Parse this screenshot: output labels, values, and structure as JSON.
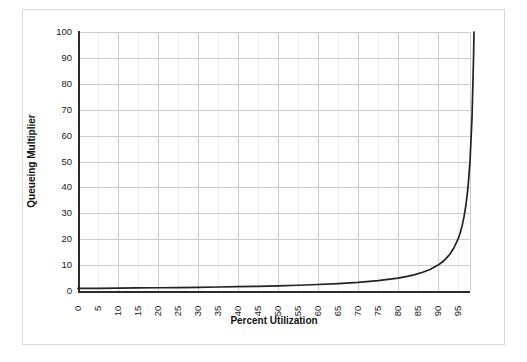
{
  "chart_data": {
    "type": "line",
    "title": "",
    "xlabel": "Percent Utilization",
    "ylabel": "Queueing Multiplier",
    "xlim": [
      0,
      98
    ],
    "ylim": [
      0,
      100
    ],
    "grid": true,
    "legend": null,
    "x_ticks": [
      0,
      5,
      10,
      15,
      20,
      25,
      30,
      35,
      40,
      45,
      50,
      55,
      60,
      65,
      70,
      75,
      80,
      85,
      90,
      95
    ],
    "y_ticks": [
      0,
      10,
      20,
      30,
      40,
      50,
      60,
      70,
      80,
      90,
      100
    ],
    "series": [
      {
        "name": "Queueing Multiplier",
        "color": "#222222",
        "x": [
          0,
          5,
          10,
          15,
          20,
          25,
          30,
          35,
          40,
          45,
          50,
          55,
          60,
          65,
          70,
          75,
          80,
          82,
          84,
          86,
          88,
          90,
          91,
          92,
          93,
          94,
          95,
          95.5,
          96,
          96.5,
          97,
          97.5,
          98,
          98.5,
          98.9,
          99
        ],
        "y": [
          1,
          1.05,
          1.11,
          1.18,
          1.25,
          1.33,
          1.43,
          1.54,
          1.67,
          1.82,
          2,
          2.22,
          2.5,
          2.86,
          3.33,
          4,
          5,
          5.56,
          6.25,
          7.14,
          8.33,
          10,
          11.1,
          12.5,
          14.3,
          16.7,
          20,
          22.2,
          25,
          28.6,
          33.3,
          40,
          50,
          66.7,
          90.9,
          100
        ]
      }
    ]
  },
  "axis": {
    "y_title": "Queueing Multiplier",
    "x_title": "Percent Utilization"
  },
  "colors": {
    "curve": "#222222",
    "axis": "#2b2b2b",
    "grid_major": "#cccccc",
    "grid_minor": "#ececec",
    "frame": "#d8d8d8",
    "text": "#1a1a1a"
  }
}
